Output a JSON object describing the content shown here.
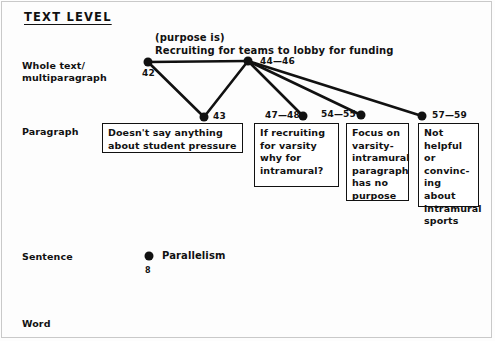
{
  "title": "TEXT LEVEL",
  "levels": [
    {
      "key": "whole",
      "label": "Whole text/\nmultiparagraph"
    },
    {
      "key": "paragraph",
      "label": "Paragraph"
    },
    {
      "key": "sentence",
      "label": "Sentence"
    },
    {
      "key": "word",
      "label": "Word"
    }
  ],
  "annotation": {
    "purpose_line": "(purpose is)\nRecruiting for teams to lobby for funding"
  },
  "nodes": {
    "n42": {
      "id": "42",
      "x": 148,
      "y": 62,
      "level": "whole"
    },
    "n4446": {
      "id": "44—46",
      "x": 248,
      "y": 61,
      "level": "whole"
    },
    "n43": {
      "id": "43",
      "x": 204,
      "y": 117,
      "level": "paragraph"
    },
    "n4748": {
      "id": "47—48",
      "x": 303,
      "y": 116,
      "level": "paragraph"
    },
    "n5455": {
      "id": "54—55",
      "x": 361,
      "y": 115,
      "level": "paragraph"
    },
    "n5759": {
      "id": "57—59",
      "x": 422,
      "y": 116,
      "level": "paragraph"
    }
  },
  "edges": [
    {
      "from": "n42",
      "to": "n4446"
    },
    {
      "from": "n42",
      "to": "n43"
    },
    {
      "from": "n4446",
      "to": "n43"
    },
    {
      "from": "n4446",
      "to": "n4748"
    },
    {
      "from": "n4446",
      "to": "n5455"
    },
    {
      "from": "n4446",
      "to": "n5759"
    }
  ],
  "boxes": {
    "b43": "Doesn't say anything\nabout student pressure",
    "b47": "If recruiting\nfor varsity\nwhy for\nintramural?",
    "b54": "Focus on\nvarsity-\nintramural\nparagraph\nhas no\npurpose",
    "b57": "Not\nhelpful\nor\nconvinc-\ning about\nintramural\nsports"
  },
  "sentence_level": {
    "label": "Parallelism",
    "count": "8"
  },
  "colors": {
    "ink": "#111111",
    "page": "#fdfdfd",
    "frame": "#c9c9c9"
  }
}
